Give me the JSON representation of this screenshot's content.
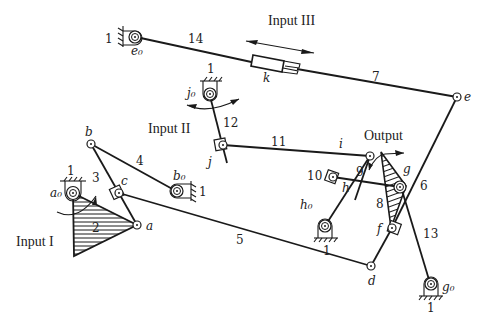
{
  "diagram": {
    "type": "planar linkage mechanism",
    "titles": {
      "input_1": "Input I",
      "input_2": "Input II",
      "input_3": "Input III",
      "output": "Output"
    },
    "ground_label": "1",
    "links": [
      {
        "id": "2",
        "label": "2"
      },
      {
        "id": "3",
        "label": "3"
      },
      {
        "id": "4",
        "label": "4"
      },
      {
        "id": "5",
        "label": "5"
      },
      {
        "id": "6",
        "label": "6"
      },
      {
        "id": "7",
        "label": "7"
      },
      {
        "id": "8",
        "label": "8"
      },
      {
        "id": "9",
        "label": "9"
      },
      {
        "id": "10",
        "label": "10"
      },
      {
        "id": "11",
        "label": "11"
      },
      {
        "id": "12",
        "label": "12"
      },
      {
        "id": "13",
        "label": "13"
      },
      {
        "id": "14",
        "label": "14"
      }
    ],
    "joints": {
      "a0": "a₀",
      "a": "a",
      "b": "b",
      "b0": "b₀",
      "c": "c",
      "d": "d",
      "e": "e",
      "e0": "e₀",
      "f": "f",
      "g": "g",
      "g0": "g₀",
      "h": "h",
      "h0": "h₀",
      "i": "i",
      "j": "j",
      "j0": "j₀",
      "k": "k"
    }
  }
}
